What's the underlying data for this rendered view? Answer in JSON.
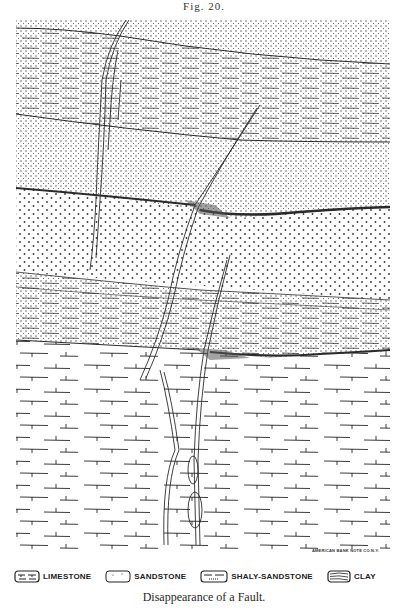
{
  "figure": {
    "number_label": "Fig. 20.",
    "caption": "Disappearance of a Fault.",
    "engraver_credit": "AMERICAN BANK NOTE CO.N.Y."
  },
  "legend": {
    "items": [
      {
        "label": "LIMESTONE",
        "pattern": "limestone-swatch"
      },
      {
        "label": "SANDSTONE",
        "pattern": "sandstone-swatch"
      },
      {
        "label": "SHALY-SANDSTONE",
        "pattern": "shaly-sandstone-swatch"
      },
      {
        "label": "CLAY",
        "pattern": "clay-swatch"
      }
    ]
  },
  "strata": [
    {
      "name": "upper-sandstone",
      "rock": "SANDSTONE",
      "position": "top"
    },
    {
      "name": "upper-shaly-sandstone",
      "rock": "SHALY-SANDSTONE",
      "position": "upper"
    },
    {
      "name": "fine-sandstone",
      "rock": "SANDSTONE",
      "position": "upper-middle"
    },
    {
      "name": "coarse-sandstone",
      "rock": "SANDSTONE",
      "position": "middle"
    },
    {
      "name": "lower-shaly-sandstone",
      "rock": "SHALY-SANDSTONE",
      "position": "lower-middle"
    },
    {
      "name": "limestone",
      "rock": "LIMESTONE",
      "position": "bottom"
    }
  ],
  "colors": {
    "ink": "#2a2a2a",
    "paper": "#ffffff"
  }
}
